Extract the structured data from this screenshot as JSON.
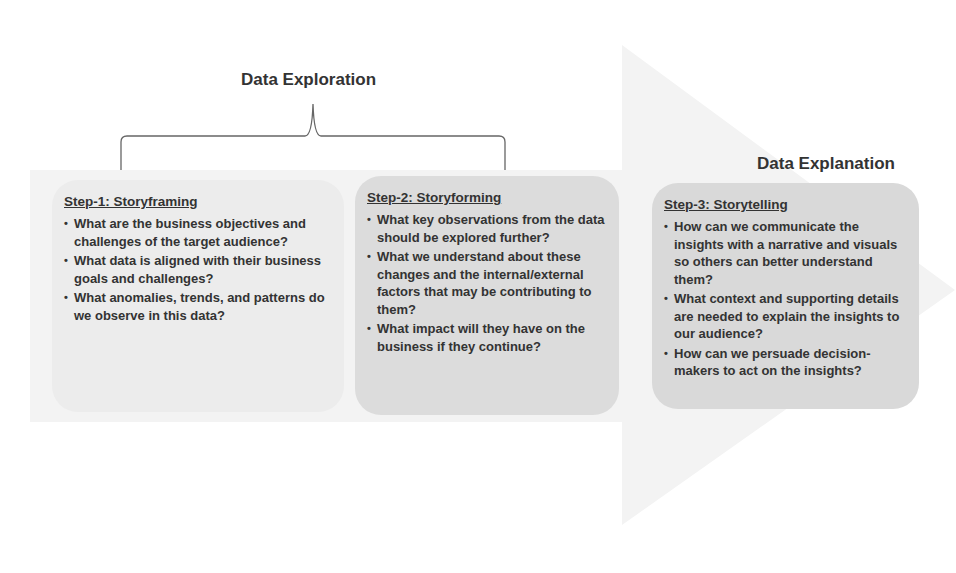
{
  "colors": {
    "arrow_fill": "#f3f3f3",
    "box1_fill": "#ececec",
    "box2_fill": "#dcdcdc",
    "box3_fill": "#d9d9d9",
    "text": "#333333",
    "bracket": "#666666"
  },
  "headings": {
    "exploration": "Data Exploration",
    "explanation": "Data Explanation"
  },
  "steps": [
    {
      "title": "Step-1: Storyframing",
      "bullets": [
        "What are the business objectives and challenges of the target audience?",
        "What data is aligned with their business goals and challenges?",
        "What anomalies, trends, and patterns do we observe in this data?"
      ]
    },
    {
      "title": "Step-2: Storyforming",
      "bullets": [
        "What key observations from the data should be explored further?",
        "What we understand about these changes and the internal/external factors that may be contributing to them?",
        "What impact will they have on the business if they continue?"
      ]
    },
    {
      "title": "Step-3: Storytelling",
      "bullets": [
        "How can we communicate the insights with a narrative and visuals so others can better understand them?",
        "What context and supporting details are needed to explain the insights to our audience?",
        "How can we persuade decision-makers to act on the insights?"
      ]
    }
  ],
  "bullet_glyph": "•"
}
